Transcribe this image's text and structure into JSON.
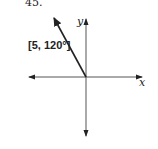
{
  "problem": {
    "number": "45."
  },
  "diagram": {
    "vector_label": "[5, 120°]",
    "x_axis_label": "x",
    "y_axis_label": "y",
    "vector": {
      "magnitude": 5,
      "angle_deg": 120
    }
  }
}
